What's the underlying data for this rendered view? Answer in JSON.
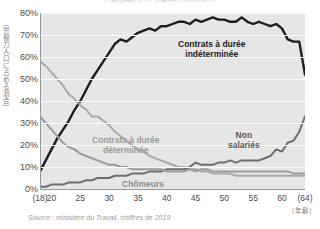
{
  "title": "労働市場における雇用形態別の割合",
  "source_note": "Source : ministère du Travail, chiffres de 2019",
  "y_axis_caption": "（労働力人口に占める割合）",
  "x_axis_caption": "（年齢）",
  "annotations": {
    "cdi_line1": "Contrats à durée",
    "cdi_line2": "indéterminée",
    "cdd_line1": "Contrats à durée",
    "cdd_line2": "déterminée",
    "non_salaries_line1": "Non",
    "non_salaries_line2": "salariés",
    "chomeurs": "Chômeurs"
  },
  "colors": {
    "plot_background": "#e6e6e6",
    "gridline": "#fbfbfb",
    "cdi": "#1d1d1d",
    "cdd": "#a9a9a9",
    "non_salaries": "#6e6e6e",
    "chomeurs": "#9c9c9c",
    "axis": "#9a9a9a",
    "tick_text": "#4a4a4a",
    "caption_text": "#7a7a7a",
    "source_text": "#9d9d9d"
  },
  "chart_data": {
    "type": "line",
    "title": "労働市場における雇用形態別の割合",
    "xlabel": "（年齢）",
    "ylabel": "（労働力人口に占める割合）",
    "xlim": [
      18,
      64
    ],
    "ylim": [
      0,
      80
    ],
    "grid": true,
    "legend_position": "inline-annotations",
    "y_ticks": [
      "0%",
      "10%",
      "20%",
      "30%",
      "40%",
      "50%",
      "60%",
      "70%",
      "80%"
    ],
    "y_tick_values": [
      0,
      10,
      20,
      30,
      40,
      50,
      60,
      70,
      80
    ],
    "x_ticks": [
      "(18)",
      "20",
      "25",
      "30",
      "35",
      "40",
      "45",
      "50",
      "55",
      "60",
      "(64)"
    ],
    "x_tick_values": [
      18,
      20,
      25,
      30,
      35,
      40,
      45,
      50,
      55,
      60,
      64
    ],
    "x": [
      18,
      19,
      20,
      21,
      22,
      23,
      24,
      25,
      26,
      27,
      28,
      29,
      30,
      31,
      32,
      33,
      34,
      35,
      36,
      37,
      38,
      39,
      40,
      41,
      42,
      43,
      44,
      45,
      46,
      47,
      48,
      49,
      50,
      51,
      52,
      53,
      54,
      55,
      56,
      57,
      58,
      59,
      60,
      61,
      62,
      63,
      64
    ],
    "series": [
      {
        "name": "Contrats à durée indéterminée",
        "color": "#1d1d1d",
        "values": [
          8,
          13,
          18,
          23,
          27,
          31,
          36,
          40,
          45,
          50,
          54,
          58,
          62,
          66,
          68,
          67,
          69,
          71,
          72,
          73,
          72,
          74,
          74,
          75,
          76,
          76,
          75,
          77,
          76,
          77,
          78,
          77,
          77,
          76,
          76,
          78,
          76,
          75,
          76,
          75,
          74,
          75,
          73,
          68,
          67,
          67,
          52
        ]
      },
      {
        "name": "Contrats à durée déterminée",
        "color": "#a9a9a9",
        "values": [
          58,
          56,
          53,
          50,
          47,
          43,
          41,
          38,
          36,
          33,
          33,
          31,
          29,
          26,
          24,
          22,
          20,
          18,
          17,
          15,
          14,
          13,
          12,
          11,
          10,
          10,
          9,
          9,
          8,
          8,
          7,
          7,
          7,
          7,
          6,
          6,
          6,
          6,
          6,
          6,
          6,
          6,
          6,
          6,
          6,
          6,
          6
        ]
      },
      {
        "name": "Non salariés",
        "color": "#6e6e6e",
        "values": [
          1,
          1,
          2,
          2,
          2,
          3,
          3,
          3,
          4,
          4,
          5,
          5,
          5,
          6,
          6,
          6,
          7,
          7,
          7,
          8,
          8,
          8,
          9,
          9,
          9,
          9,
          10,
          12,
          11,
          11,
          11,
          12,
          12,
          13,
          12,
          13,
          13,
          13,
          13,
          14,
          15,
          18,
          17,
          21,
          22,
          26,
          33
        ]
      },
      {
        "name": "Chômeurs",
        "color": "#9c9c9c",
        "values": [
          33,
          30,
          27,
          24,
          21,
          19,
          18,
          16,
          15,
          14,
          13,
          12,
          11,
          11,
          10,
          10,
          9,
          9,
          9,
          9,
          9,
          9,
          8,
          8,
          8,
          8,
          9,
          8,
          9,
          9,
          8,
          8,
          8,
          8,
          8,
          8,
          8,
          8,
          8,
          8,
          8,
          8,
          8,
          8,
          7,
          7,
          7
        ]
      }
    ]
  }
}
